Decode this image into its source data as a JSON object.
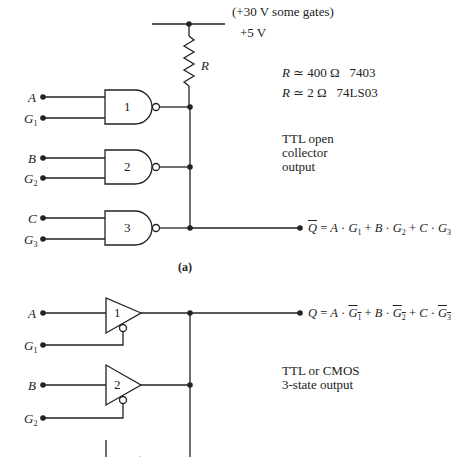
{
  "supply": {
    "alt_voltage": "(+30 V some gates)",
    "voltage": "+5 V",
    "resistor_label": "R"
  },
  "resistor_notes": [
    {
      "lhs": "R",
      "rel": "≃",
      "value": "400 Ω",
      "part": "7403"
    },
    {
      "lhs": "R",
      "rel": "≃",
      "value": "2 Ω",
      "part": "74LS03"
    }
  ],
  "part_a": {
    "caption": "(a)",
    "description": [
      "TTL open",
      "collector",
      "output"
    ],
    "gates": [
      {
        "number": "1",
        "input": "A",
        "gate": "G",
        "gate_sub": "1"
      },
      {
        "number": "2",
        "input": "B",
        "gate": "G",
        "gate_sub": "2"
      },
      {
        "number": "3",
        "input": "C",
        "gate": "G",
        "gate_sub": "3"
      }
    ],
    "output_equation": {
      "output": "Q",
      "output_inverted": true,
      "terms": [
        {
          "input": "A",
          "gate": "G",
          "sub": "1"
        },
        {
          "input": "B",
          "gate": "G",
          "sub": "2"
        },
        {
          "input": "C",
          "gate": "G",
          "sub": "3"
        }
      ]
    }
  },
  "part_b": {
    "description": [
      "TTL or CMOS",
      "3-state output"
    ],
    "buffers": [
      {
        "number": "1",
        "input": "A",
        "gate": "G",
        "gate_sub": "1"
      },
      {
        "number": "2",
        "input": "B",
        "gate": "G",
        "gate_sub": "2"
      },
      {
        "number": "3",
        "input": "C",
        "gate": "G",
        "gate_sub": "3"
      }
    ],
    "output_equation": {
      "output": "Q",
      "output_inverted": false,
      "terms": [
        {
          "input": "A",
          "gate": "G",
          "sub": "1",
          "gate_inverted": true
        },
        {
          "input": "B",
          "gate": "G",
          "sub": "2",
          "gate_inverted": true
        },
        {
          "input": "C",
          "gate": "G",
          "sub": "3",
          "gate_inverted": true
        }
      ]
    }
  }
}
